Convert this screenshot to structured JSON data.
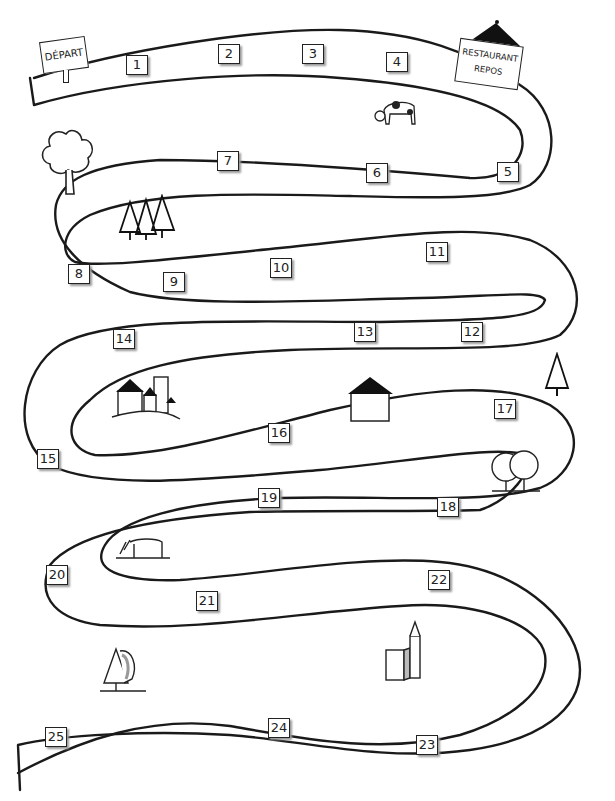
{
  "start": {
    "label": "DÉPART"
  },
  "restaurant": {
    "line1": "RESTAURANT",
    "line2": "REPOS"
  },
  "squares": [
    {
      "n": "1",
      "x": 126,
      "y": 55
    },
    {
      "n": "2",
      "x": 218,
      "y": 44
    },
    {
      "n": "3",
      "x": 302,
      "y": 44
    },
    {
      "n": "4",
      "x": 386,
      "y": 52
    },
    {
      "n": "5",
      "x": 497,
      "y": 162
    },
    {
      "n": "6",
      "x": 366,
      "y": 163
    },
    {
      "n": "7",
      "x": 217,
      "y": 151
    },
    {
      "n": "8",
      "x": 68,
      "y": 264
    },
    {
      "n": "9",
      "x": 163,
      "y": 272
    },
    {
      "n": "10",
      "x": 270,
      "y": 258
    },
    {
      "n": "11",
      "x": 426,
      "y": 242
    },
    {
      "n": "12",
      "x": 461,
      "y": 322
    },
    {
      "n": "13",
      "x": 354,
      "y": 322
    },
    {
      "n": "14",
      "x": 113,
      "y": 329
    },
    {
      "n": "15",
      "x": 37,
      "y": 449
    },
    {
      "n": "16",
      "x": 268,
      "y": 423
    },
    {
      "n": "17",
      "x": 494,
      "y": 399
    },
    {
      "n": "18",
      "x": 437,
      "y": 497
    },
    {
      "n": "19",
      "x": 258,
      "y": 488
    },
    {
      "n": "20",
      "x": 46,
      "y": 565
    },
    {
      "n": "21",
      "x": 196,
      "y": 591
    },
    {
      "n": "22",
      "x": 428,
      "y": 570
    },
    {
      "n": "23",
      "x": 416,
      "y": 735
    },
    {
      "n": "24",
      "x": 268,
      "y": 718
    },
    {
      "n": "25",
      "x": 45,
      "y": 727
    }
  ],
  "scenery": [
    "cow-icon",
    "deciduous-tree-icon",
    "pine-forest-icon",
    "castle-icon",
    "house-icon",
    "pine-tree-icon",
    "two-trees-icon",
    "horse-icon",
    "tree-icon",
    "church-icon"
  ]
}
